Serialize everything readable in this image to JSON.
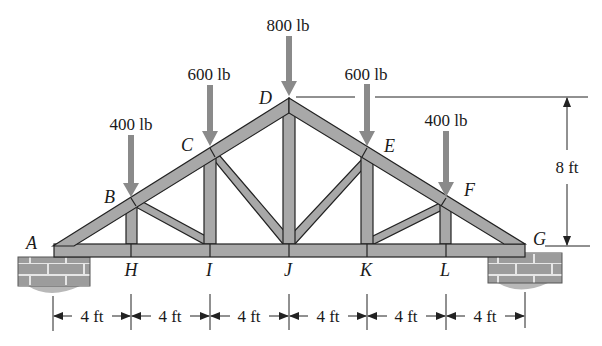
{
  "diagram": {
    "type": "roof truss with point loads",
    "colors": {
      "member_fill": "#a8a8a8",
      "member_stroke": "#222222",
      "load_arrow": "#8a8a8a",
      "brick_fill": "#9c9c9c",
      "brick_mortar": "#e6e6e6",
      "dimension_line": "#222222"
    },
    "nodes": [
      {
        "id": "A",
        "label": "A",
        "x": 53,
        "y": 246
      },
      {
        "id": "B",
        "label": "B",
        "x": 131,
        "y": 200
      },
      {
        "id": "C",
        "label": "C",
        "x": 210,
        "y": 153
      },
      {
        "id": "D",
        "label": "D",
        "x": 289,
        "y": 98
      },
      {
        "id": "E",
        "label": "E",
        "x": 367,
        "y": 153
      },
      {
        "id": "F",
        "label": "F",
        "x": 446,
        "y": 200
      },
      {
        "id": "G",
        "label": "G",
        "x": 525,
        "y": 246
      },
      {
        "id": "H",
        "label": "H",
        "x": 131,
        "y": 246
      },
      {
        "id": "I",
        "label": "I",
        "x": 210,
        "y": 246
      },
      {
        "id": "J",
        "label": "J",
        "x": 289,
        "y": 246
      },
      {
        "id": "K",
        "label": "K",
        "x": 367,
        "y": 246
      },
      {
        "id": "L",
        "label": "L",
        "x": 446,
        "y": 246
      }
    ],
    "members": [
      [
        "A",
        "B"
      ],
      [
        "B",
        "C"
      ],
      [
        "C",
        "D"
      ],
      [
        "D",
        "E"
      ],
      [
        "E",
        "F"
      ],
      [
        "F",
        "G"
      ],
      [
        "A",
        "H"
      ],
      [
        "H",
        "I"
      ],
      [
        "I",
        "J"
      ],
      [
        "J",
        "K"
      ],
      [
        "K",
        "L"
      ],
      [
        "L",
        "G"
      ],
      [
        "B",
        "H"
      ],
      [
        "C",
        "I"
      ],
      [
        "D",
        "J"
      ],
      [
        "E",
        "K"
      ],
      [
        "F",
        "L"
      ],
      [
        "B",
        "I"
      ],
      [
        "C",
        "J"
      ],
      [
        "E",
        "J"
      ],
      [
        "F",
        "K"
      ]
    ],
    "loads": [
      {
        "node": "B",
        "label": "400 lb"
      },
      {
        "node": "C",
        "label": "600 lb"
      },
      {
        "node": "D",
        "label": "800 lb"
      },
      {
        "node": "E",
        "label": "600 lb"
      },
      {
        "node": "F",
        "label": "400 lb"
      }
    ],
    "supports": [
      {
        "node": "A",
        "type": "brick pier"
      },
      {
        "node": "G",
        "type": "brick pier"
      }
    ],
    "dimensions": {
      "horizontal": [
        "4 ft",
        "4 ft",
        "4 ft",
        "4 ft",
        "4 ft",
        "4 ft"
      ],
      "vertical": "8 ft"
    }
  }
}
